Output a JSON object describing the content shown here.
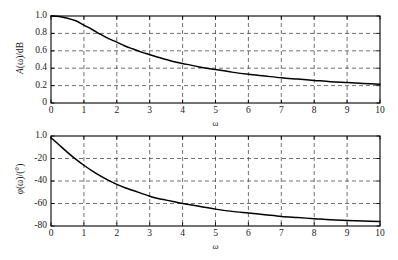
{
  "figure": {
    "background": "#ffffff",
    "curve_color": "#000000",
    "grid_color": "#4d4d4d",
    "axis_color": "#000000"
  },
  "chart_data": [
    {
      "type": "line",
      "id": "magnitude-response",
      "title": "",
      "xlabel": "ω",
      "ylabel": "A(ω)/dB",
      "ylabel_parts": {
        "pre": "A",
        "paren": "(ω)/dB"
      },
      "xlim": [
        0,
        10
      ],
      "ylim": [
        0,
        1.0
      ],
      "grid": true,
      "grid_style": "dashed",
      "legend": "none",
      "xticks": [
        0,
        1,
        2,
        3,
        4,
        5,
        6,
        7,
        8,
        9,
        10
      ],
      "xticklabels": [
        "0",
        "1",
        "2",
        "3",
        "4",
        "5",
        "6",
        "7",
        "8",
        "9",
        "10"
      ],
      "yticks": [
        0,
        0.2,
        0.4,
        0.6,
        0.8,
        1.0
      ],
      "yticklabels": [
        "0",
        "0.2",
        "0.4",
        "0.6",
        "0.8",
        "1.0"
      ],
      "x": [
        0,
        0.25,
        0.5,
        0.75,
        1.0,
        1.25,
        1.5,
        1.75,
        2.0,
        2.25,
        2.5,
        2.75,
        3.0,
        3.25,
        3.5,
        3.75,
        4.0,
        4.5,
        5.0,
        5.5,
        6.0,
        6.5,
        7.0,
        7.5,
        8.0,
        8.5,
        9.0,
        9.5,
        10.0
      ],
      "values": [
        1.0,
        0.995,
        0.975,
        0.945,
        0.895,
        0.845,
        0.79,
        0.74,
        0.7,
        0.655,
        0.62,
        0.585,
        0.555,
        0.525,
        0.5,
        0.475,
        0.455,
        0.415,
        0.385,
        0.355,
        0.33,
        0.31,
        0.29,
        0.275,
        0.26,
        0.245,
        0.235,
        0.225,
        0.215
      ]
    },
    {
      "type": "line",
      "id": "phase-response",
      "title": "",
      "xlabel": "ω",
      "ylabel": "φ(ω)/(°)",
      "ylabel_parts": {
        "pre": "φ",
        "paren": "(ω)/(°)"
      },
      "xlim": [
        0,
        10
      ],
      "ylim": [
        -80,
        0
      ],
      "grid": true,
      "grid_style": "dashed",
      "legend": "none",
      "xticks": [
        0,
        1,
        2,
        3,
        4,
        5,
        6,
        7,
        8,
        9,
        10
      ],
      "xticklabels": [
        "0",
        "1",
        "2",
        "3",
        "4",
        "5",
        "6",
        "7",
        "8",
        "9",
        "10"
      ],
      "yticks": [
        -80,
        -60,
        -40,
        -20,
        0
      ],
      "yticklabels": [
        "-80",
        "-60",
        "-40",
        "-20",
        "1.0"
      ],
      "x": [
        0,
        0.25,
        0.5,
        0.75,
        1.0,
        1.25,
        1.5,
        1.75,
        2.0,
        2.25,
        2.5,
        2.75,
        3.0,
        3.25,
        3.5,
        3.75,
        4.0,
        4.5,
        5.0,
        5.5,
        6.0,
        6.5,
        7.0,
        7.5,
        8.0,
        8.5,
        9.0,
        9.5,
        10.0
      ],
      "values": [
        -1.5,
        -8.0,
        -14.5,
        -20.5,
        -26.0,
        -31.0,
        -35.5,
        -39.5,
        -43.0,
        -46.0,
        -48.5,
        -51.0,
        -53.5,
        -55.5,
        -57.0,
        -58.5,
        -60.0,
        -62.5,
        -65.0,
        -67.0,
        -68.5,
        -70.0,
        -71.5,
        -72.5,
        -73.5,
        -74.5,
        -75.0,
        -75.5,
        -76.0
      ]
    }
  ]
}
